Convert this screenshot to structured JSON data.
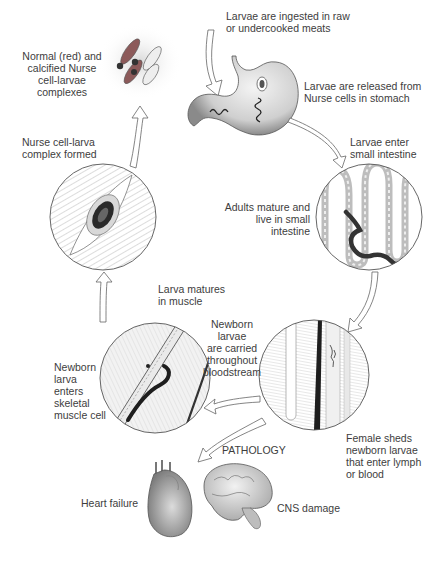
{
  "diagram": {
    "type": "life-cycle",
    "stages": [
      {
        "id": "ingestion",
        "label": "Larvae are ingested in raw\nor undercooked meats"
      },
      {
        "id": "stomach",
        "label": "Larvae are released from\nNurse cells in stomach"
      },
      {
        "id": "enter-intestine",
        "label": "Larvae enter\nsmall intestine"
      },
      {
        "id": "adults",
        "label": "Adults mature and\nlive in small\nintestine"
      },
      {
        "id": "female-sheds",
        "label": "Female sheds\nnewborn larvae\nthat enter lymph\nor blood"
      },
      {
        "id": "bloodstream",
        "label": "Newborn larvae\nare carried\nthroughout\nbloodstream"
      },
      {
        "id": "enters-muscle",
        "label": "Newborn\nlarva\nenters\nskeletal\nmuscle cell"
      },
      {
        "id": "matures",
        "label": "Larva matures\nin muscle"
      },
      {
        "id": "complex-formed",
        "label": "Nurse cell-larva\ncomplex formed"
      },
      {
        "id": "calcified",
        "label": "Normal (red) and\ncalcified Nurse\ncell-larvae\ncomplexes"
      }
    ],
    "pathology": {
      "title": "PATHOLOGY",
      "items": [
        {
          "id": "heart",
          "label": "Heart failure"
        },
        {
          "id": "cns",
          "label": "CNS damage"
        }
      ]
    },
    "colors": {
      "nurse_cell_red": "#b05050",
      "line": "#555555",
      "text": "#3d3d3d"
    }
  }
}
